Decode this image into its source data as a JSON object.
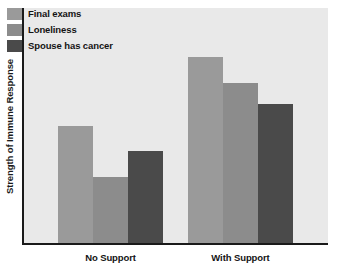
{
  "chart_data": {
    "type": "bar",
    "title": "",
    "xlabel": "",
    "ylabel": "Strength of Immune Response",
    "categories": [
      "No Support",
      "With Support"
    ],
    "series": [
      {
        "name": "Final exams",
        "color": "#9a9a9a",
        "values": [
          50,
          79
        ]
      },
      {
        "name": "Loneliness",
        "color": "#8c8c8c",
        "values": [
          28,
          68
        ]
      },
      {
        "name": "Spouse has cancer",
        "color": "#4a4a4a",
        "values": [
          39,
          59
        ]
      }
    ],
    "ylim": [
      0,
      100
    ],
    "y_ticks": [],
    "grid": false,
    "legend_position": "top-left",
    "axis_color": "#1a1a1a",
    "plot_background": "#e9e9e9"
  },
  "legend": {
    "items": [
      {
        "label": "Final exams"
      },
      {
        "label": "Loneliness"
      },
      {
        "label": "Spouse has cancer"
      }
    ]
  },
  "axes": {
    "y_title": "Strength of Immune Response",
    "category_labels": [
      "No Support",
      "With Support"
    ]
  }
}
